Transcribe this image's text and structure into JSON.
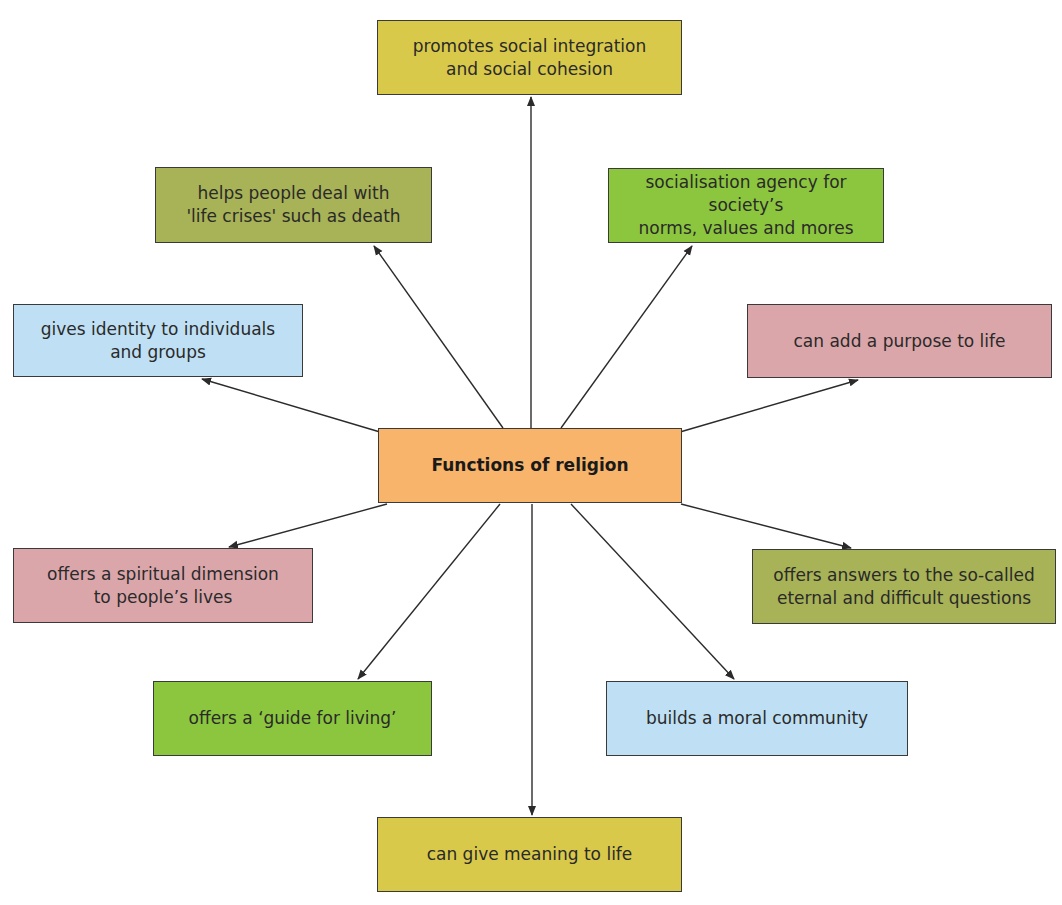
{
  "diagram": {
    "type": "mind-map",
    "center": {
      "label": "Functions of religion",
      "color": "#f7b46a",
      "box": [
        378,
        428,
        304,
        75
      ]
    },
    "nodes": [
      {
        "id": "integration",
        "label": "promotes social integration\nand social cohesion",
        "color": "#d9c94a",
        "box": [
          377,
          20,
          305,
          75
        ]
      },
      {
        "id": "life-crises",
        "label": "helps people deal with\n'life crises' such as death",
        "color": "#a8b257",
        "box": [
          155,
          167,
          277,
          76
        ]
      },
      {
        "id": "socialisation",
        "label": "socialisation agency for society’s\nnorms, values and mores",
        "color": "#8cc63f",
        "box": [
          608,
          168,
          276,
          75
        ]
      },
      {
        "id": "identity",
        "label": "gives identity to individuals\nand groups",
        "color": "#bfe0f4",
        "box": [
          13,
          304,
          290,
          73
        ]
      },
      {
        "id": "purpose",
        "label": "can add a purpose to life",
        "color": "#dba6aa",
        "box": [
          747,
          304,
          305,
          74
        ]
      },
      {
        "id": "spiritual",
        "label": "offers a spiritual dimension\nto people’s lives",
        "color": "#dba6aa",
        "box": [
          13,
          548,
          300,
          75
        ]
      },
      {
        "id": "answers",
        "label": "offers answers to the so-called\neternal and difficult questions",
        "color": "#a8b257",
        "box": [
          752,
          549,
          304,
          75
        ]
      },
      {
        "id": "guide",
        "label": "offers a ‘guide for living’",
        "color": "#8cc63f",
        "box": [
          153,
          681,
          279,
          75
        ]
      },
      {
        "id": "moral",
        "label": "builds a moral community",
        "color": "#bfe0f4",
        "box": [
          606,
          681,
          302,
          75
        ]
      },
      {
        "id": "meaning",
        "label": "can give meaning to life",
        "color": "#d9c94a",
        "box": [
          377,
          817,
          305,
          75
        ]
      }
    ],
    "arrows": [
      {
        "to": "integration",
        "from_xy": [
          531,
          428
        ],
        "to_xy": [
          531,
          97
        ]
      },
      {
        "to": "life-crises",
        "from_xy": [
          503,
          428
        ],
        "to_xy": [
          374,
          246
        ]
      },
      {
        "to": "socialisation",
        "from_xy": [
          561,
          428
        ],
        "to_xy": [
          692,
          246
        ]
      },
      {
        "to": "identity",
        "from_xy": [
          380,
          432
        ],
        "to_xy": [
          202,
          379
        ]
      },
      {
        "to": "purpose",
        "from_xy": [
          680,
          432
        ],
        "to_xy": [
          858,
          380
        ]
      },
      {
        "to": "spiritual",
        "from_xy": [
          387,
          504
        ],
        "to_xy": [
          229,
          547
        ]
      },
      {
        "to": "answers",
        "from_xy": [
          681,
          504
        ],
        "to_xy": [
          851,
          548
        ]
      },
      {
        "to": "guide",
        "from_xy": [
          500,
          504
        ],
        "to_xy": [
          358,
          679
        ]
      },
      {
        "to": "meaning",
        "from_xy": [
          532,
          504
        ],
        "to_xy": [
          532,
          815
        ]
      },
      {
        "to": "moral",
        "from_xy": [
          571,
          504
        ],
        "to_xy": [
          734,
          679
        ]
      }
    ],
    "line_color": "#2b2b2b"
  }
}
